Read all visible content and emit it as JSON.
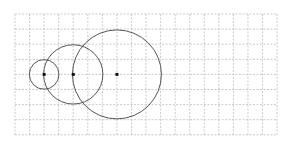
{
  "diagram": {
    "type": "geometry-grid-figure",
    "grid": {
      "origin_px": [
        15,
        14
      ],
      "columns": 18,
      "rows": 8,
      "cell_w_px": 14.56,
      "cell_h_px": 15.1,
      "line_color": "#bdbdbd",
      "line_style": "dashed"
    },
    "circles": [
      {
        "id": "circle-1",
        "center_grid": [
          2,
          4
        ],
        "radius_units": 1,
        "stroke": "#555555"
      },
      {
        "id": "circle-2",
        "center_grid": [
          4,
          4
        ],
        "radius_units": 2,
        "stroke": "#555555"
      },
      {
        "id": "circle-3",
        "center_grid": [
          7,
          4
        ],
        "radius_units": 3,
        "stroke": "#555555"
      }
    ],
    "center_points": [
      {
        "id": "center-1",
        "grid": [
          2,
          4
        ]
      },
      {
        "id": "center-2",
        "grid": [
          4,
          4
        ]
      },
      {
        "id": "center-3",
        "grid": [
          7,
          4
        ]
      }
    ],
    "point_color": "#111111"
  }
}
